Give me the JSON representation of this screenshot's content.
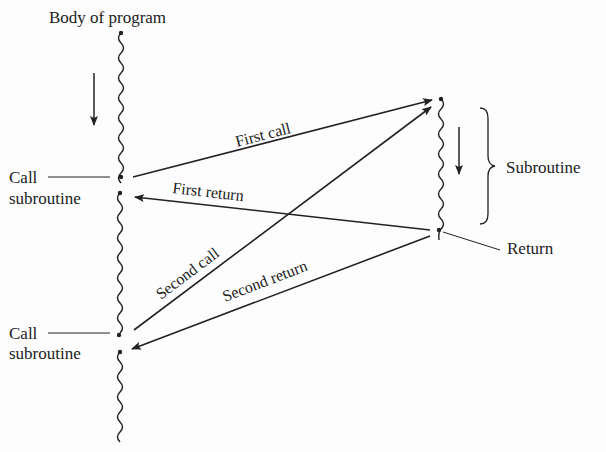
{
  "diagram": {
    "colors": {
      "ink": "#222222",
      "background": "#fdfdfd"
    },
    "labels": {
      "body_of_program": "Body of program",
      "call_1_line1": "Call",
      "call_1_line2": "subroutine",
      "call_2_line1": "Call",
      "call_2_line2": "subroutine",
      "subroutine": "Subroutine",
      "return": "Return"
    },
    "arrows": {
      "first_call": "First call",
      "first_return": "First return",
      "second_call": "Second call",
      "second_return": "Second return"
    },
    "icons": {
      "flow_direction_main": "down-arrow-icon",
      "flow_direction_subroutine": "down-arrow-icon",
      "brace": "right-curly-brace-icon"
    }
  }
}
